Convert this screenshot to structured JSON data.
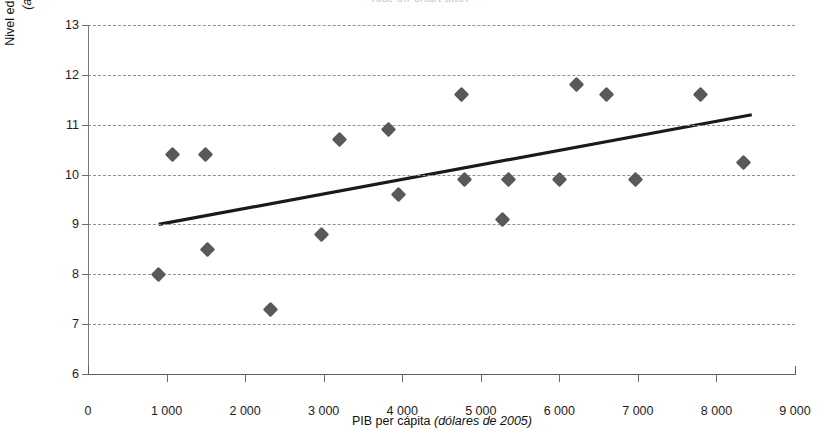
{
  "figure": {
    "title_fragment": "(cut-off chart title)"
  },
  "chart_data": {
    "type": "scatter",
    "title": "",
    "xlabel_plain": "PIB per cápita",
    "xlabel_italic": "(dólares de 2005)",
    "ylabel_line1": "Nivel educativo de la PEA urbana",
    "ylabel_line2": "(años de educación)",
    "xlim": [
      0,
      9000
    ],
    "ylim": [
      6,
      13
    ],
    "xticks": [
      0,
      1000,
      2000,
      3000,
      4000,
      5000,
      6000,
      7000,
      8000,
      9000
    ],
    "xtick_labels": [
      "0",
      "1 000",
      "2 000",
      "3 000",
      "4 000",
      "5 000",
      "6 000",
      "7 000",
      "8 000",
      "9 000"
    ],
    "yticks": [
      6,
      7,
      8,
      9,
      10,
      11,
      12,
      13
    ],
    "ytick_labels": [
      "6",
      "7",
      "8",
      "9",
      "10",
      "11",
      "12",
      "13"
    ],
    "grid": "horizontal-dashed",
    "legend": "none",
    "marker_color": "#595959",
    "marker_shape": "diamond",
    "trendline_color": "#1a1a1a",
    "gridline_color": "#8f8f96",
    "points": [
      {
        "x": 900,
        "y": 8.0
      },
      {
        "x": 1080,
        "y": 10.4
      },
      {
        "x": 1500,
        "y": 10.4
      },
      {
        "x": 1520,
        "y": 8.5
      },
      {
        "x": 2320,
        "y": 7.3
      },
      {
        "x": 2970,
        "y": 8.8
      },
      {
        "x": 3200,
        "y": 10.7
      },
      {
        "x": 3830,
        "y": 10.9
      },
      {
        "x": 3950,
        "y": 9.6
      },
      {
        "x": 4750,
        "y": 11.6
      },
      {
        "x": 4790,
        "y": 9.9
      },
      {
        "x": 5280,
        "y": 9.1
      },
      {
        "x": 5350,
        "y": 9.9
      },
      {
        "x": 6000,
        "y": 9.9
      },
      {
        "x": 6220,
        "y": 11.8
      },
      {
        "x": 6600,
        "y": 11.6
      },
      {
        "x": 6970,
        "y": 9.9
      },
      {
        "x": 7800,
        "y": 11.6
      },
      {
        "x": 8350,
        "y": 10.25
      }
    ],
    "trendline": {
      "x0": 900,
      "y0": 9.0,
      "x1": 8450,
      "y1": 11.2
    }
  }
}
